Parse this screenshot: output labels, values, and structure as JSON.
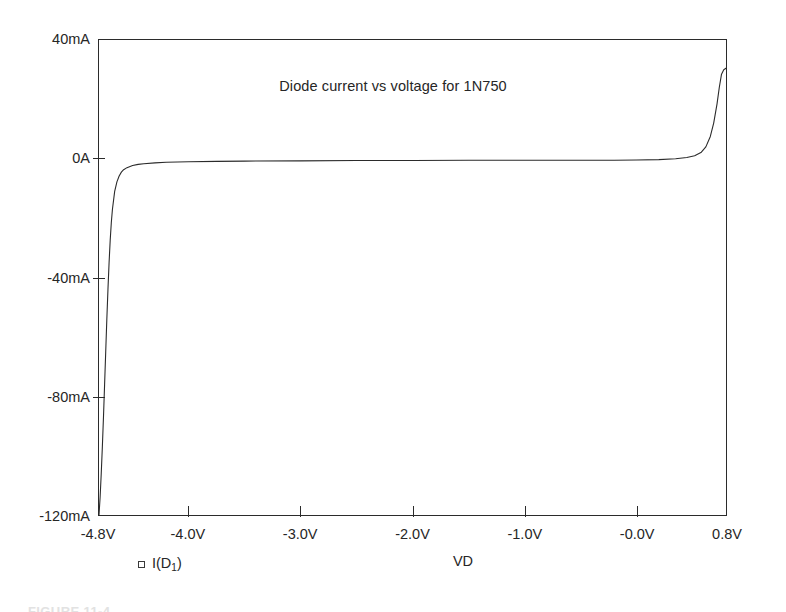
{
  "figure": {
    "background_color": "#ffffff",
    "line_color": "#2b2b2b",
    "axis_color": "#2b2b2b",
    "caption": "FIGURE 11-4"
  },
  "legend": {
    "marker": "open-square-marker",
    "label_prefix": "I(D",
    "label_subscript": "1",
    "label_suffix": ")",
    "label": "I(D1)"
  },
  "chart_data": {
    "type": "line",
    "title": "Diode current vs voltage for 1N750",
    "xlabel": "VD",
    "ylabel": "",
    "xlim": [
      -4.8,
      0.8
    ],
    "ylim": [
      -0.12,
      0.04
    ],
    "grid": false,
    "legend_position": "below-left",
    "xtick_labels": [
      "-4.8V",
      "-4.0V",
      "-3.0V",
      "-2.0V",
      "-1.0V",
      "-0.0V",
      "0.8V"
    ],
    "xtick_values": [
      -4.8,
      -4.0,
      -3.0,
      -2.0,
      -1.0,
      0.0,
      0.8
    ],
    "ytick_labels": [
      "40mA",
      "0A",
      "-40mA",
      "-80mA",
      "-120mA"
    ],
    "ytick_values": [
      0.04,
      0.0,
      -0.04,
      -0.08,
      -0.12
    ],
    "series": [
      {
        "name": "I(D1)",
        "x": [
          -4.8,
          -4.79,
          -4.78,
          -4.77,
          -4.76,
          -4.75,
          -4.74,
          -4.73,
          -4.72,
          -4.71,
          -4.7,
          -4.69,
          -4.68,
          -4.66,
          -4.64,
          -4.62,
          -4.6,
          -4.58,
          -4.55,
          -4.5,
          -4.45,
          -4.4,
          -4.3,
          -4.2,
          -4.0,
          -3.75,
          -3.5,
          -3.0,
          -2.5,
          -2.0,
          -1.5,
          -1.0,
          -0.5,
          -0.2,
          0.0,
          0.2,
          0.35,
          0.45,
          0.52,
          0.58,
          0.62,
          0.66,
          0.69,
          0.72,
          0.74,
          0.76,
          0.78,
          0.8
        ],
        "y": [
          -0.12,
          -0.114,
          -0.106,
          -0.097,
          -0.087,
          -0.076,
          -0.065,
          -0.054,
          -0.044,
          -0.035,
          -0.0275,
          -0.0215,
          -0.017,
          -0.011,
          -0.0078,
          -0.0058,
          -0.0045,
          -0.0037,
          -0.003,
          -0.0023,
          -0.0019,
          -0.0017,
          -0.0014,
          -0.0012,
          -0.001,
          -0.0009,
          -0.0008,
          -0.0007,
          -0.0006,
          -0.0006,
          -0.0005,
          -0.0005,
          -0.0005,
          -0.0005,
          -0.0004,
          -0.0003,
          0.0,
          0.0004,
          0.001,
          0.0022,
          0.004,
          0.0075,
          0.012,
          0.0185,
          0.024,
          0.0285,
          0.03,
          0.0305
        ]
      }
    ]
  }
}
